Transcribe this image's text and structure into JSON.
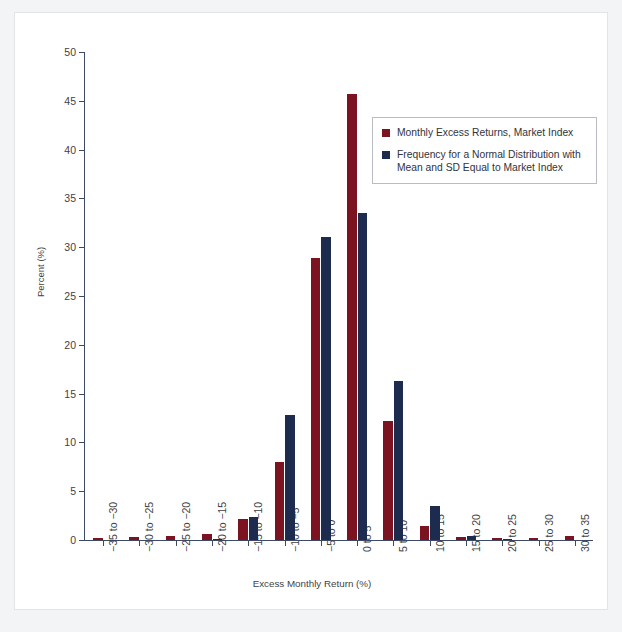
{
  "chart_data": {
    "type": "bar",
    "title": "",
    "xlabel": "Excess Monthly Return (%)",
    "ylabel": "Percent (%)",
    "ylim": [
      0,
      50
    ],
    "ytick_step": 5,
    "yticks": [
      0,
      5,
      10,
      15,
      20,
      25,
      30,
      35,
      40,
      45,
      50
    ],
    "grid": false,
    "legend_position": "upper-right-inside",
    "categories": [
      "−35 to −30",
      "−30 to −25",
      "−25 to −20",
      "−20 to −15",
      "−15 to −10",
      "−10 to −5",
      "−5 to 0",
      "0 to 5",
      "5 to 10",
      "10 to 15",
      "15 to 20",
      "20 to 25",
      "25 to 30",
      "30 to 35"
    ],
    "series": [
      {
        "name": "Monthly Excess Returns, Market Index",
        "color": "#7b1420",
        "values": [
          0.2,
          0.3,
          0.4,
          0.6,
          2.2,
          8.0,
          28.9,
          45.7,
          12.2,
          1.4,
          0.3,
          0.2,
          0.2,
          0.4
        ]
      },
      {
        "name": "Frequency for a Normal Distribution with Mean and SD Equal to Market Index",
        "color": "#1d2c4e",
        "values": [
          0.0,
          0.0,
          0.0,
          0.1,
          2.4,
          12.8,
          31.0,
          33.5,
          16.3,
          3.5,
          0.4,
          0.1,
          0.0,
          0.0
        ]
      }
    ]
  },
  "legend": {
    "entries": [
      {
        "label": "Monthly Excess Returns, Market Index"
      },
      {
        "label": "Frequency for a Normal Distribution with Mean and SD Equal to Market Index"
      }
    ]
  },
  "axes": {
    "y_title": "Percent (%)",
    "x_title": "Excess Monthly Return (%)"
  },
  "colors": {
    "series_red": "#7b1420",
    "series_navy": "#1d2c4e",
    "axis": "#3c4a63",
    "page_background": "#f3f4f6",
    "card_background": "#ffffff"
  }
}
